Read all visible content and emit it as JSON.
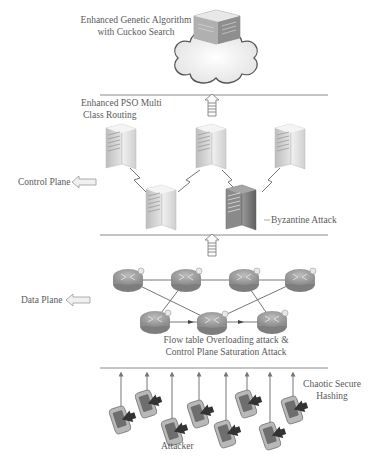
{
  "title": "",
  "layers": {
    "cloud": {
      "label_line1": "Enhanced Genetic Algorithm",
      "label_line2": "with Cuckoo Search",
      "icon": "cloud-server-icon"
    },
    "control": {
      "routing_label_line1": "Enhanced PSO Multi",
      "routing_label_line2": "Class Routing",
      "plane_label": "Control Plane",
      "attack_label": "Byzantine Attack",
      "servers": 5,
      "compromised_server_index": 4
    },
    "data": {
      "plane_label": "Data Plane",
      "attack_label_line1": "Flow table Overloading attack &",
      "attack_label_line2": "Control Plane Saturation Attack",
      "routers": 7
    },
    "devices": {
      "hashing_label_line1": "Chaotic Secure",
      "hashing_label_line2": "Hashing",
      "attacker_label": "Attacker",
      "count": 8
    }
  },
  "colors": {
    "line": "#8a8a8a",
    "server_light": "#e4e4e4",
    "server_dark": "#7a7a7a",
    "router": "#9a9a9a",
    "arrow": "#777777"
  }
}
